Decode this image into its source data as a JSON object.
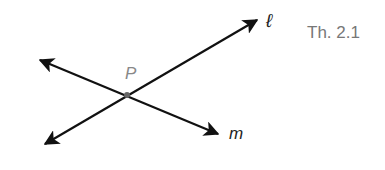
{
  "figure": {
    "theorem_label": "Th. 2.1",
    "point_label": "P",
    "line1_label": "ℓ",
    "line2_label": "m"
  },
  "colors": {
    "line": "#111111",
    "point": "#777777",
    "theorem_text": "#777777"
  }
}
